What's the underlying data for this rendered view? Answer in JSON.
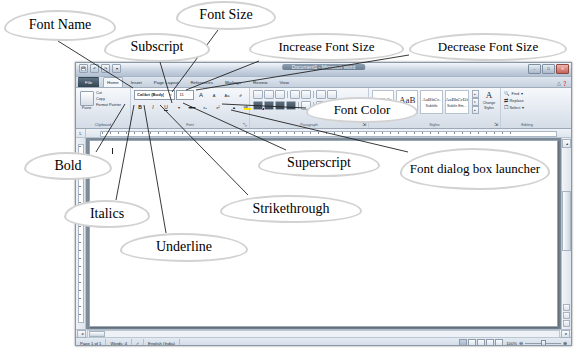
{
  "figure": {
    "kind": "annotated-screenshot"
  },
  "callouts": [
    {
      "id": "font-name",
      "label": "Font Name",
      "x": 4,
      "y": 10,
      "w": 112,
      "h": 31,
      "fs": 14
    },
    {
      "id": "font-size",
      "label": "Font Size",
      "x": 176,
      "y": 1,
      "w": 100,
      "h": 29,
      "fs": 14
    },
    {
      "id": "subscript",
      "label": "Subscript",
      "x": 104,
      "y": 33,
      "w": 106,
      "h": 29,
      "fs": 14
    },
    {
      "id": "increase-font",
      "label": "Increase Font Size",
      "x": 249,
      "y": 33,
      "w": 155,
      "h": 28,
      "fs": 13
    },
    {
      "id": "decrease-font",
      "label": "Decrease Font Size",
      "x": 409,
      "y": 33,
      "w": 158,
      "h": 28,
      "fs": 13
    },
    {
      "id": "font-color",
      "label": "Font Color",
      "x": 306,
      "y": 97,
      "w": 112,
      "h": 26,
      "fs": 13
    },
    {
      "id": "bold",
      "label": "Bold",
      "x": 24,
      "y": 152,
      "w": 88,
      "h": 28,
      "fs": 14
    },
    {
      "id": "superscript",
      "label": "Superscript",
      "x": 258,
      "y": 150,
      "w": 122,
      "h": 27,
      "fs": 14
    },
    {
      "id": "font-dialog",
      "label": "Font dialog box launcher",
      "x": 400,
      "y": 148,
      "w": 150,
      "h": 42,
      "fs": 13
    },
    {
      "id": "italics",
      "label": "Italics",
      "x": 64,
      "y": 200,
      "w": 86,
      "h": 28,
      "fs": 14
    },
    {
      "id": "strikethrough",
      "label": "Strikethrough",
      "x": 220,
      "y": 195,
      "w": 142,
      "h": 28,
      "fs": 14
    },
    {
      "id": "underline",
      "label": "Underline",
      "x": 120,
      "y": 233,
      "w": 128,
      "h": 29,
      "fs": 14
    }
  ],
  "leader_lines": [
    {
      "id": "leader-font-name",
      "from": [
        58,
        41
      ],
      "to": [
        133,
        88
      ]
    },
    {
      "id": "leader-font-size",
      "from": [
        218,
        30
      ],
      "to": [
        172,
        92
      ]
    },
    {
      "id": "leader-subscript",
      "from": [
        160,
        62
      ],
      "to": [
        172,
        103
      ]
    },
    {
      "id": "leader-increase",
      "from": [
        259,
        61
      ],
      "to": [
        186,
        90
      ]
    },
    {
      "id": "leader-decrease",
      "from": [
        409,
        55
      ],
      "to": [
        196,
        90
      ]
    },
    {
      "id": "leader-bold",
      "from": [
        96,
        152
      ],
      "to": [
        125,
        104
      ]
    },
    {
      "id": "leader-italics",
      "from": [
        116,
        200
      ],
      "to": [
        134,
        105
      ]
    },
    {
      "id": "leader-underline",
      "from": [
        166,
        233
      ],
      "to": [
        144,
        105
      ]
    },
    {
      "id": "leader-strikethrough",
      "from": [
        248,
        195
      ],
      "to": [
        160,
        105
      ]
    },
    {
      "id": "leader-superscript",
      "from": [
        286,
        150
      ],
      "to": [
        183,
        103
      ]
    },
    {
      "id": "leader-fontdialog",
      "from": [
        408,
        152
      ],
      "to": [
        231,
        110
      ]
    },
    {
      "id": "leader-fontcolor",
      "from": [
        306,
        108
      ],
      "to": [
        222,
        104
      ]
    }
  ],
  "word": {
    "titlebar": {
      "title": "Document1 - Microsoft Word",
      "quick_access": [
        "save-icon",
        "undo-icon",
        "redo-icon",
        "customize-qat-icon"
      ],
      "window_buttons": [
        "minimize",
        "restore",
        "close"
      ]
    },
    "tabs": [
      {
        "label": "File",
        "active": false,
        "file": true
      },
      {
        "label": "Home",
        "active": true,
        "file": false
      },
      {
        "label": "Insert",
        "active": false,
        "file": false
      },
      {
        "label": "Page Layout",
        "active": false,
        "file": false
      },
      {
        "label": "References",
        "active": false,
        "file": false
      },
      {
        "label": "Mailings",
        "active": false,
        "file": false
      },
      {
        "label": "Review",
        "active": false,
        "file": false
      },
      {
        "label": "View",
        "active": false,
        "file": false
      }
    ],
    "ribbon": {
      "clipboard": {
        "group_label": "Clipboard",
        "paste_label": "Paste",
        "items": [
          "Cut",
          "Copy",
          "Format Painter"
        ]
      },
      "font": {
        "group_label": "Font",
        "font_name": "Calibri (Body)",
        "font_size": "11",
        "buttons": [
          "grow-font-icon",
          "shrink-font-icon",
          "change-case-icon",
          "clear-formatting-icon",
          "bold-icon",
          "italic-icon",
          "underline-icon",
          "strikethrough-icon",
          "subscript-icon",
          "superscript-icon",
          "text-effects-icon",
          "text-highlight-color-icon",
          "font-color-icon"
        ],
        "bold_glyph": "B",
        "italic_glyph": "I",
        "underline_glyph": "U",
        "strikethrough_glyph": "abe",
        "subscript_glyph": "x₂",
        "superscript_glyph": "x²",
        "grow_glyph": "A",
        "shrink_glyph": "A",
        "case_glyph": "Aa",
        "clear_glyph": "✐",
        "highlight_glyph": "ab",
        "color_glyph": "A",
        "highlight_color": "#ffe400",
        "font_color": "#c00000",
        "dialog_launcher": "⤡"
      },
      "paragraph": {
        "group_label": "Paragraph"
      },
      "styles": {
        "group_label": "Styles",
        "gallery": [
          {
            "sample": "AaBbCc",
            "name": "Heading 2",
            "big": false
          },
          {
            "sample": "AaB",
            "name": "Title",
            "big": true
          },
          {
            "sample": "AaBbCc.",
            "name": "Subtitle",
            "big": false
          },
          {
            "sample": "AaBbCcDi",
            "name": "Subtle Em...",
            "big": false
          }
        ],
        "change_styles_label": "Change Styles",
        "change_styles_glyph": "A"
      },
      "editing": {
        "group_label": "Editing",
        "items": [
          {
            "label": "Find",
            "icon": "binoculars-icon"
          },
          {
            "label": "Replace",
            "icon": "replace-icon"
          },
          {
            "label": "Select",
            "icon": "select-icon"
          }
        ]
      }
    },
    "statusbar": {
      "page": "Page 1 of 1",
      "words": "Words: 4",
      "proofing": "proofing-errors-icon",
      "language": "English (India)",
      "zoom_level": "100%",
      "zoom_out": "⊖",
      "zoom_in": "⊕",
      "views": [
        "print-layout",
        "full-screen-reading",
        "web-layout",
        "outline",
        "draft"
      ]
    }
  }
}
